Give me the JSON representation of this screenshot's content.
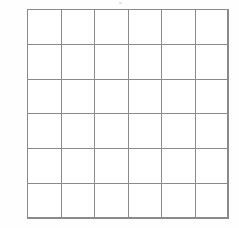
{
  "figure": {
    "kind": "blank-grid",
    "rows": 6,
    "columns": 6,
    "cell_text": [
      [
        "",
        "",
        "",
        "",
        "",
        ""
      ],
      [
        "",
        "",
        "",
        "",
        "",
        ""
      ],
      [
        "",
        "",
        "",
        "",
        "",
        ""
      ],
      [
        "",
        "",
        "",
        "",
        "",
        ""
      ],
      [
        "",
        "",
        "",
        "",
        "",
        ""
      ],
      [
        "",
        "",
        "",
        "",
        "",
        ""
      ]
    ],
    "colors": {
      "background": "#fefefe",
      "cell_fill": "#ffffff",
      "grid_line": "#8a8a8a"
    },
    "geometry": {
      "left": 27,
      "top": 9,
      "width": 201,
      "height": 209,
      "cell_width": 33.5,
      "cell_height": 34.83,
      "line_width": 1
    }
  }
}
